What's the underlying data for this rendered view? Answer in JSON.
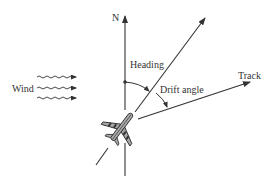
{
  "diagram": {
    "type": "navigation-vector-diagram",
    "labels": {
      "north": "N",
      "heading": "Heading",
      "drift_angle": "Drift angle",
      "track": "Track",
      "wind": "Wind"
    },
    "elements": {
      "north_axis": {
        "direction": "up"
      },
      "heading_vector": {
        "direction": "north-east"
      },
      "track_vector": {
        "direction": "east-north-east"
      },
      "wind_arrows": {
        "count": 3,
        "direction": "right"
      },
      "aircraft": {
        "orientation": "along heading"
      }
    },
    "colors": {
      "line": "#333333",
      "aircraft_fill": "#a8a8a8",
      "background": "#ffffff"
    }
  }
}
